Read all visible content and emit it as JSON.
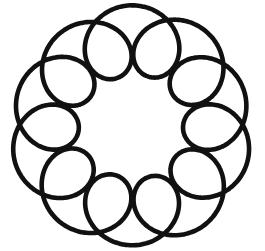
{
  "canvas": {
    "width": 265,
    "height": 251,
    "background_color": "#ffffff",
    "title": "Spirograph rosette line drawing"
  },
  "drawing": {
    "name": "epitrochoid-rosette",
    "description": "Hand-drawn black ink rosette: a single closed looping curve forming 11 petal loops arranged around a circular central opening, with a scalloped outer boundary.",
    "medium": "black ink line drawing on white background",
    "stroke_color": "#111111",
    "stroke_width": 4.6,
    "fill": "none",
    "closed": true,
    "center_x": 132,
    "center_y": 127,
    "petal_count": 11,
    "outer_radius": 118,
    "inner_hole_radius": 58,
    "petal_loop_radius": 33,
    "rotation_degrees": -90,
    "sample_points": 1400,
    "wobble_amplitude": 1.6,
    "wobble_frequency": 3,
    "geometry": {
      "type": "epitrochoid",
      "fixed_radius_R": 86,
      "rolling_radius_r": 8.6,
      "pen_offset_d": 34
    }
  }
}
